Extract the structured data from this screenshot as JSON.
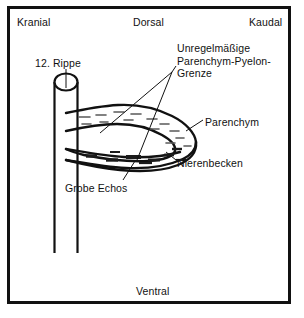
{
  "figure": {
    "type": "anatomical-ultrasound-schematic",
    "orientation_labels": {
      "cranial": "Kranial",
      "dorsal": "Dorsal",
      "caudal": "Kaudal",
      "ventral": "Ventral"
    },
    "annotations": [
      {
        "id": "rippe",
        "text": "12. Rippe"
      },
      {
        "id": "unregelmaessige",
        "text": "Unregelmäßige\nParenchym-Pyelon-\nGrenze"
      },
      {
        "id": "parenchym",
        "text": "Parenchym"
      },
      {
        "id": "nierenbecken",
        "text": "Nierenbecken"
      },
      {
        "id": "grobe_echos",
        "text": "Grobe Echos"
      }
    ],
    "colors": {
      "ink": "#111111",
      "background": "#ffffff"
    }
  }
}
